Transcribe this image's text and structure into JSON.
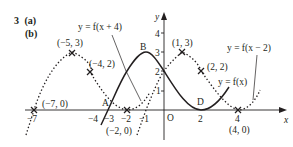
{
  "question": {
    "number": "3",
    "part_a": "(a)",
    "part_b": "(b)"
  },
  "axes": {
    "x_label": "x",
    "y_label": "y",
    "origin_label": "O",
    "x_ticks": [
      "−7",
      "−4",
      "−3",
      "−2",
      "−1",
      "2",
      "4"
    ],
    "y_ticks": [
      "1",
      "2",
      "3",
      "4"
    ]
  },
  "curves": {
    "f": {
      "label": "y = f(x)",
      "style": "solid"
    },
    "f_plus_4": {
      "label": "y = f(x + 4)",
      "style": "dotted"
    },
    "f_minus_2": {
      "label": "y = f(x − 2)",
      "style": "dotted"
    }
  },
  "points": {
    "A": "A",
    "B": "B",
    "D": "D",
    "p1": "(−5, 3)",
    "p2": "(−4, 2)",
    "p3": "(−7, 0)",
    "p4": "(−2, 0)",
    "p5": "(1, 3)",
    "p6": "(2, 2)",
    "p7": "(4, 0)"
  },
  "colors": {
    "ink": "#231f20",
    "background": "#ffffff"
  }
}
